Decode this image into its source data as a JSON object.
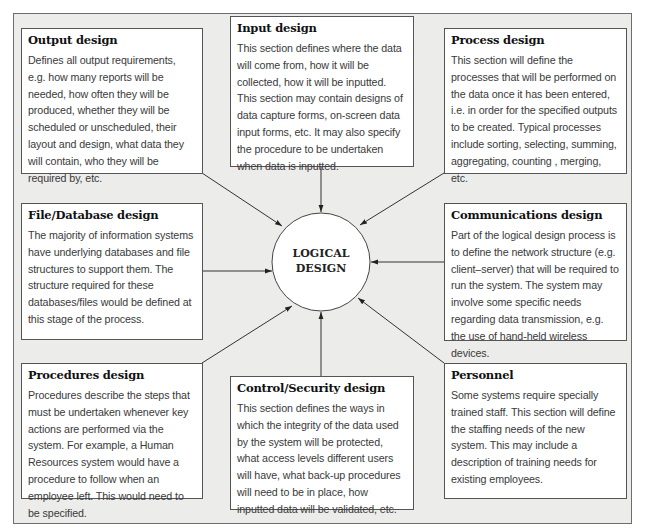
{
  "page": {
    "cut_off_heading": "Logical design"
  },
  "center": {
    "label_line1": "LOGICAL",
    "label_line2": "DESIGN"
  },
  "boxes": {
    "output": {
      "title": "Output design",
      "text": "Defines all output requirements, e.g. how many reports will be needed, how often they will be produced, whether they will be scheduled or unscheduled, their layout and design, what data they will contain, who they will be required by, etc."
    },
    "input": {
      "title": "Input design",
      "text": "This section defines where the data will come from, how it will be collected, how it will be inputted. This section may contain designs of data capture forms, on-screen data input forms, etc. It may also specify the procedure to be undertaken when data is inputted."
    },
    "process": {
      "title": "Process design",
      "text": "This section will define the processes that will be performed on the data once it has been entered, i.e. in order for the specified outputs to be created. Typical processes include sorting, selecting, summing, aggregating, counting , merging, etc."
    },
    "file_database": {
      "title": "File/Database design",
      "text": "The majority of information systems have underlying databases and file structures to support them. The structure required for these databases/files would be defined at this stage of the process."
    },
    "communications": {
      "title": "Communications design",
      "text": "Part of the logical design process is to define the network structure (e.g. client–server) that will be required to run the system. The system may involve some specific needs regarding data transmission, e.g. the use of hand-held wireless devices."
    },
    "procedures": {
      "title": "Procedures design",
      "text": "Procedures describe the steps that must be undertaken whenever key actions are performed via the system. For example, a Human Resources system would have a procedure to follow when an employee left. This would need to be specified."
    },
    "control_security": {
      "title": "Control/Security design",
      "text": "This section defines the ways in which the integrity of the data used by the system will be protected, what access levels different users will have, what back-up procedures will need to be in place, how inputted data will be validated, etc."
    },
    "personnel": {
      "title": "Personnel",
      "text": "Some systems require specially trained staff. This section will define the staffing needs of the new system. This may include a description of training needs for existing employees."
    }
  },
  "colors": {
    "frame_background": "#ececea",
    "frame_border": "#6d6d6d",
    "box_background": "#ffffff",
    "box_border": "#555555",
    "arrow": "#333333"
  }
}
